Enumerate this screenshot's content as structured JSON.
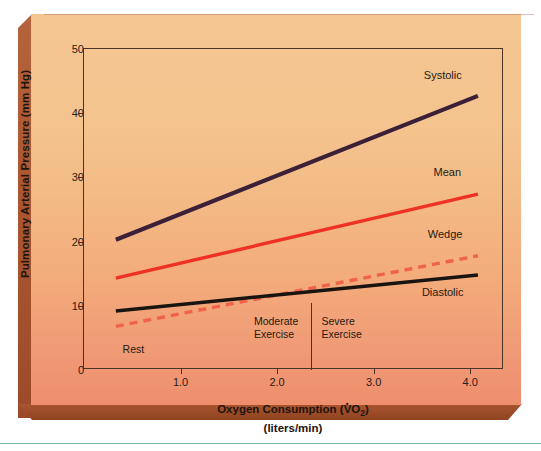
{
  "chart_data": {
    "type": "line",
    "title": "",
    "xlabel": "Oxygen Consumption (V̇O2)",
    "xlabel_sub": "(liters/min)",
    "ylabel": "Pulmonary Arterial Pressure (mm Hg)",
    "xlim": [
      0,
      4.35
    ],
    "ylim": [
      0,
      50
    ],
    "grid": false,
    "legend_position": "right-inline-end-labels",
    "x_ticks": [
      {
        "value": 1.0,
        "label": "1.0"
      },
      {
        "value": 2.0,
        "label": "2.0"
      },
      {
        "value": 3.0,
        "label": "3.0"
      },
      {
        "value": 4.0,
        "label": "4.0"
      }
    ],
    "y_ticks": [
      {
        "value": 0,
        "label": "0"
      },
      {
        "value": 10,
        "label": "10"
      },
      {
        "value": 20,
        "label": "20"
      },
      {
        "value": 30,
        "label": "30"
      },
      {
        "value": 40,
        "label": "40"
      },
      {
        "value": 50,
        "label": "50"
      }
    ],
    "series": [
      {
        "name": "Systolic",
        "color": "#3c2038",
        "style": "solid",
        "width": 4.2,
        "x": [
          0.33,
          4.08
        ],
        "values": [
          20.3,
          42.7
        ],
        "label_x": 3.52,
        "label_y": 46.0
      },
      {
        "name": "Mean",
        "color": "#ee3124",
        "style": "solid",
        "width": 3.4,
        "x": [
          0.33,
          4.08
        ],
        "values": [
          14.3,
          27.4
        ],
        "label_x": 3.62,
        "label_y": 30.9
      },
      {
        "name": "Wedge",
        "color": "#f1624a",
        "style": "dashed",
        "width": 3.4,
        "x": [
          0.33,
          4.08
        ],
        "values": [
          6.8,
          17.8
        ],
        "label_x": 3.56,
        "label_y": 21.2
      },
      {
        "name": "Diastolic",
        "color": "#1a1410",
        "style": "solid",
        "width": 3.4,
        "x": [
          0.33,
          4.08
        ],
        "values": [
          9.2,
          14.8
        ],
        "label_x": 3.5,
        "label_y": 12.1
      }
    ],
    "zones": [
      {
        "name": "Rest",
        "lines": [
          "Rest"
        ],
        "x": 0.4,
        "y": 4.2
      },
      {
        "name": "Moderate Exercise",
        "lines": [
          "Moderate",
          "Exercise"
        ],
        "x": 1.76,
        "y": 8.6
      },
      {
        "name": "Severe Exercise",
        "lines": [
          "Severe",
          "Exercise"
        ],
        "x": 2.46,
        "y": 8.6
      }
    ],
    "dividers": [
      {
        "name": "moderate-severe-divider",
        "x": 2.35,
        "y_top": 10.5,
        "y_bottom": 0
      }
    ]
  },
  "figure": {
    "background_top": "#f4c692",
    "background_bottom": "#ee8e6d",
    "bevel_color": "#a8542f",
    "axis_color": "#4a3226",
    "rule_color": "#7fb5a4"
  }
}
